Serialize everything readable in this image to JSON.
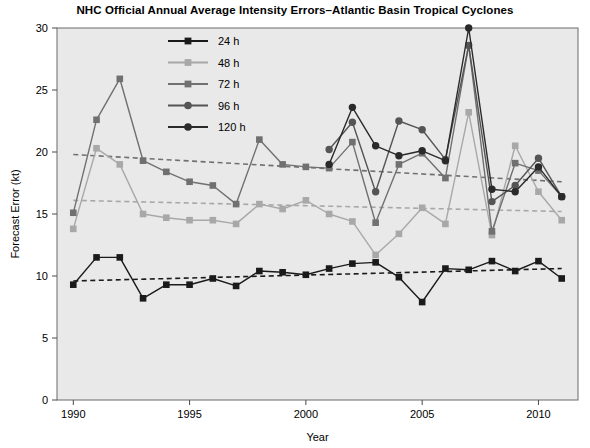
{
  "chart_data": {
    "type": "line",
    "title": "NHC Official Annual Average Intensity Errors–Atlantic Basin Tropical Cyclones",
    "xlabel": "Year",
    "ylabel": "Forecast Error (kt)",
    "xlim": [
      1989.3,
      2011.7
    ],
    "ylim": [
      0,
      30
    ],
    "xticks": [
      1990,
      1995,
      2000,
      2005,
      2010
    ],
    "yticks": [
      0,
      5,
      10,
      15,
      20,
      25,
      30
    ],
    "grid": false,
    "legend_position": "top-left-inside",
    "x": [
      1990,
      1991,
      1992,
      1993,
      1994,
      1995,
      1996,
      1997,
      1998,
      1999,
      2000,
      2001,
      2002,
      2003,
      2004,
      2005,
      2006,
      2007,
      2008,
      2009,
      2010,
      2011
    ],
    "series": [
      {
        "name": "24 h",
        "label": "24 h",
        "color": "#1a1a1a",
        "marker": "square",
        "values": [
          9.3,
          11.5,
          11.5,
          8.2,
          9.3,
          9.3,
          9.8,
          9.2,
          10.4,
          10.3,
          10.1,
          10.6,
          11.0,
          11.1,
          9.9,
          7.9,
          10.6,
          10.5,
          11.2,
          10.4,
          11.2,
          9.8
        ]
      },
      {
        "name": "48 h",
        "label": "48 h",
        "color": "#a8a8a8",
        "marker": "square",
        "values": [
          13.8,
          20.3,
          19.0,
          15.0,
          14.7,
          14.5,
          14.5,
          14.2,
          15.8,
          15.4,
          16.1,
          15.0,
          14.4,
          11.7,
          13.4,
          15.5,
          14.2,
          23.2,
          13.3,
          20.5,
          16.8,
          14.5
        ]
      },
      {
        "name": "72 h",
        "label": "72 h",
        "color": "#707070",
        "marker": "square",
        "values": [
          15.1,
          22.6,
          25.9,
          19.3,
          18.4,
          17.6,
          17.3,
          15.8,
          21.0,
          19.0,
          18.8,
          18.7,
          20.8,
          14.3,
          19.0,
          19.9,
          17.9,
          28.6,
          13.6,
          19.1,
          18.5,
          16.4
        ]
      },
      {
        "name": "96 h",
        "label": "96 h",
        "color": "#555555",
        "marker": "circle",
        "values": [
          null,
          null,
          null,
          null,
          null,
          null,
          null,
          null,
          null,
          null,
          null,
          20.2,
          22.4,
          16.8,
          22.5,
          21.8,
          19.4,
          28.6,
          16.0,
          17.3,
          19.5,
          16.4
        ]
      },
      {
        "name": "120 h",
        "label": "120 h",
        "color": "#2a2a2a",
        "marker": "circle",
        "values": [
          null,
          null,
          null,
          null,
          null,
          null,
          null,
          null,
          null,
          null,
          null,
          19.0,
          23.6,
          20.5,
          19.7,
          20.1,
          19.3,
          30.0,
          17.0,
          16.8,
          18.8,
          16.4
        ]
      }
    ],
    "trendlines": [
      {
        "name": "24 h trend",
        "color": "#1a1a1a",
        "x": [
          1990,
          2011
        ],
        "y": [
          9.6,
          10.6
        ]
      },
      {
        "name": "48 h trend",
        "color": "#a8a8a8",
        "x": [
          1990,
          2011
        ],
        "y": [
          16.1,
          15.2
        ]
      },
      {
        "name": "72 h trend",
        "color": "#707070",
        "x": [
          1990,
          2011
        ],
        "y": [
          19.8,
          17.6
        ]
      }
    ]
  },
  "legend": {
    "items": [
      {
        "label": "24 h"
      },
      {
        "label": "48 h"
      },
      {
        "label": "72 h"
      },
      {
        "label": "96 h"
      },
      {
        "label": "120 h"
      }
    ]
  }
}
